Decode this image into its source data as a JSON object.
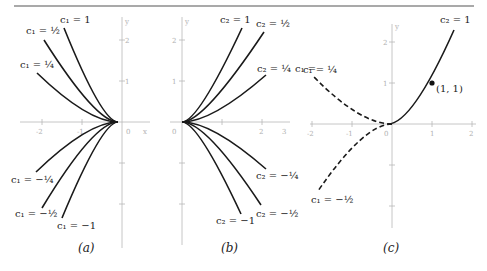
{
  "figure": {
    "top_rule": true,
    "panels": [
      {
        "id": "a",
        "caption": "(a)",
        "equation_family": "y = c1 x^2, x <= 0",
        "axis_labels": {
          "x": "x",
          "y": "y"
        },
        "x_ticks": [
          "-2",
          "-1",
          "0",
          "x"
        ],
        "y_ticks": [
          "2",
          "1"
        ],
        "curves": [
          {
            "param": "c1",
            "value_label": "1",
            "c": 1
          },
          {
            "param": "c1",
            "value_label": "1/2",
            "c": 0.5
          },
          {
            "param": "c1",
            "value_label": "1/4",
            "c": 0.25
          },
          {
            "param": "c1",
            "value_label": "-1/4",
            "c": -0.25
          },
          {
            "param": "c1",
            "value_label": "-1/2",
            "c": -0.5
          },
          {
            "param": "c1",
            "value_label": "-1",
            "c": -1
          }
        ],
        "labels": {
          "c1_1": "c₁ = 1",
          "c1_half": "c₁ = ½",
          "c1_quarter": "c₁ = ¼",
          "c1_neg_quarter": "c₁ = −¼",
          "c1_neg_half": "c₁ = −½",
          "c1_neg_1": "c₁ = −1"
        }
      },
      {
        "id": "b",
        "caption": "(b)",
        "equation_family": "y = c2 x^2, x >= 0",
        "axis_labels": {
          "x": "x",
          "y": "y"
        },
        "x_ticks": [
          "0",
          "1",
          "2",
          "3"
        ],
        "y_ticks": [
          "2",
          "1"
        ],
        "curves": [
          {
            "param": "c2",
            "value_label": "1",
            "c": 1
          },
          {
            "param": "c2",
            "value_label": "1/2",
            "c": 0.5
          },
          {
            "param": "c2",
            "value_label": "1/4",
            "c": 0.25
          },
          {
            "param": "c2",
            "value_label": "-1/4",
            "c": -0.25
          },
          {
            "param": "c2",
            "value_label": "-1/2",
            "c": -0.5
          },
          {
            "param": "c2",
            "value_label": "-1",
            "c": -1
          }
        ],
        "labels": {
          "c2_1": "c₂ = 1",
          "c2_half": "c₂ = ½",
          "c2_quarter": "c₂ = ¼",
          "c2_neg_quarter": "c₂ = −¼",
          "c2_neg_half": "c₂ = −½",
          "c2_neg_1": "c₂ = −1"
        }
      },
      {
        "id": "c",
        "caption": "(c)",
        "axis_labels": {
          "x": "x",
          "y": "y"
        },
        "x_ticks": [
          "-2",
          "-1",
          "0",
          "1",
          "2"
        ],
        "y_ticks": [
          "2",
          "1"
        ],
        "solid_curve": {
          "param": "c2",
          "value_label": "1",
          "c": 1,
          "domain": "x >= 0"
        },
        "dashed_curves": [
          {
            "param": "c1",
            "value_label": "1/4",
            "c": 0.25,
            "domain": "x <= 0"
          },
          {
            "param": "c1",
            "value_label": "-1/2",
            "c": -0.5,
            "domain": "x <= 0"
          }
        ],
        "point": {
          "label": "(1, 1)",
          "x": 1,
          "y": 1
        },
        "labels": {
          "c2_1": "c₂ = 1",
          "c1_quarter": "c₁ = ¼",
          "c1_neg_half": "c₁ = −½",
          "point": "(1, 1)"
        }
      }
    ],
    "stray_text": "c₁ ="
  }
}
